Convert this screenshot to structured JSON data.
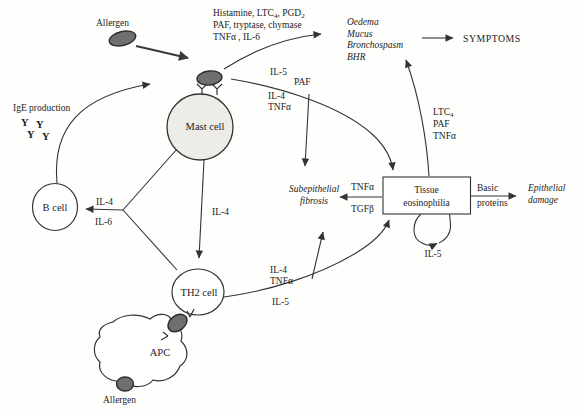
{
  "figure": {
    "allergen_top_label": "Allergen",
    "allergen_bottom_label": "Allergen",
    "ige_production_label": "IgE production",
    "ige_antibody_glyph": "Y",
    "cells": {
      "mast": "Mast cell",
      "b": "B cell",
      "th2": "TH2 cell",
      "apc": "APC"
    },
    "mast_mediators": {
      "l1_a": "Histamine, LTC",
      "l1_s1": "4",
      "l1_b": ", PGD",
      "l1_s2": "2",
      "l2": "PAF, tryptase, chymase",
      "l3": "TNFα , IL-6"
    },
    "acute_effects": [
      "Oedema",
      "Mucus",
      "Bronchospasm",
      "BHR"
    ],
    "symptoms_label": "SYMPTOMS",
    "mast_eos_path_labels": {
      "il5": "IL-5",
      "paf": "PAF",
      "il4": "IL-4",
      "tnfa": "TNFα"
    },
    "mast_b_path_labels": {
      "il4": "IL-4",
      "il6": "IL-6"
    },
    "mast_th2_path_label": "IL-4",
    "th2_path_labels": {
      "il4": "IL-4",
      "tnfa": "TNFα",
      "il5": "IL-5"
    },
    "eos_up_path_labels": {
      "ltc": "LTC",
      "ltc_sub": "4",
      "paf": "PAF",
      "tnfa": "TNFα"
    },
    "fibrosis_label": {
      "l1": "Subepithelial",
      "l2": "fibrosis"
    },
    "fibrosis_path_labels": {
      "tnfa": "TNFα",
      "tgfb": "TGFβ"
    },
    "tissue_box_label": {
      "l1": "Tissue",
      "l2": "eosinophilia"
    },
    "basic_proteins_label": {
      "l1": "Basic",
      "l2": "proteins"
    },
    "epithelial_damage_label": {
      "l1": "Epithelial",
      "l2": "damage"
    },
    "il5_loop_label": "IL-5"
  }
}
